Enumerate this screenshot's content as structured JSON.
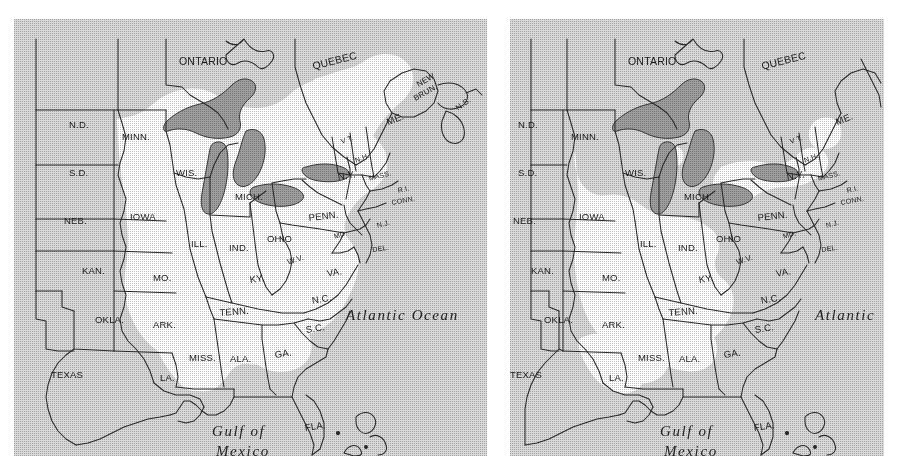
{
  "figure": {
    "type": "paired-range-map",
    "region": "Eastern North America",
    "panels": [
      {
        "id": "left",
        "name": "left-map",
        "range_extent": "larger",
        "water_labels": [
          {
            "text": "Atlantic Ocean",
            "x": 332,
            "y": 288
          },
          {
            "text": "Gulf of",
            "x": 198,
            "y": 404
          },
          {
            "text": "Mexico",
            "x": 202,
            "y": 424
          }
        ],
        "labels": [
          {
            "text": "ONTARIO",
            "x": 165,
            "y": 36,
            "rot": 0,
            "size": "big"
          },
          {
            "text": "QUEBEC",
            "x": 297,
            "y": 41,
            "rot": -14,
            "size": "big"
          },
          {
            "text": "NEW",
            "x": 401,
            "y": 62,
            "rot": -30,
            "size": "small"
          },
          {
            "text": "BRUN.",
            "x": 398,
            "y": 76,
            "rot": -30,
            "size": "small"
          },
          {
            "text": "N.S.",
            "x": 440,
            "y": 86,
            "rot": -36,
            "size": "small"
          },
          {
            "text": "N.D.",
            "x": 55,
            "y": 100,
            "rot": 0,
            "size": ""
          },
          {
            "text": "MINN.",
            "x": 108,
            "y": 112,
            "rot": 0,
            "size": ""
          },
          {
            "text": "ME.",
            "x": 371,
            "y": 98,
            "rot": -22,
            "size": ""
          },
          {
            "text": "S.D.",
            "x": 55,
            "y": 148,
            "rot": 0,
            "size": ""
          },
          {
            "text": "WIS.",
            "x": 162,
            "y": 148,
            "rot": 0,
            "size": ""
          },
          {
            "text": "V T.",
            "x": 326,
            "y": 119,
            "rot": -18,
            "size": "tiny"
          },
          {
            "text": "N.Y.",
            "x": 323,
            "y": 152,
            "rot": -8,
            "size": ""
          },
          {
            "text": "N.H.",
            "x": 340,
            "y": 138,
            "rot": -20,
            "size": "tiny"
          },
          {
            "text": "MASS.",
            "x": 354,
            "y": 156,
            "rot": -14,
            "size": "tiny"
          },
          {
            "text": "R.I.",
            "x": 383,
            "y": 168,
            "rot": -12,
            "size": "tiny"
          },
          {
            "text": "CONN.",
            "x": 377,
            "y": 180,
            "rot": -10,
            "size": "tiny"
          },
          {
            "text": "MICH.",
            "x": 221,
            "y": 172,
            "rot": 0,
            "size": ""
          },
          {
            "text": "NEB.",
            "x": 50,
            "y": 196,
            "rot": 0,
            "size": ""
          },
          {
            "text": "IOWA",
            "x": 116,
            "y": 192,
            "rot": 0,
            "size": ""
          },
          {
            "text": "PENN.",
            "x": 294,
            "y": 193,
            "rot": -6,
            "size": ""
          },
          {
            "text": "N.J.",
            "x": 362,
            "y": 203,
            "rot": -14,
            "size": "tiny"
          },
          {
            "text": "ILL.",
            "x": 177,
            "y": 219,
            "rot": 0,
            "size": ""
          },
          {
            "text": "IND.",
            "x": 215,
            "y": 223,
            "rot": 0,
            "size": ""
          },
          {
            "text": "OHIO",
            "x": 253,
            "y": 214,
            "rot": 0,
            "size": ""
          },
          {
            "text": "MD.",
            "x": 319,
            "y": 214,
            "rot": -16,
            "size": "tiny"
          },
          {
            "text": "DEL.",
            "x": 358,
            "y": 227,
            "rot": -8,
            "size": "tiny"
          },
          {
            "text": "KAN.",
            "x": 68,
            "y": 246,
            "rot": 0,
            "size": ""
          },
          {
            "text": "MO.",
            "x": 139,
            "y": 253,
            "rot": 0,
            "size": ""
          },
          {
            "text": "KY.",
            "x": 235,
            "y": 255,
            "rot": -8,
            "size": ""
          },
          {
            "text": "W.V.",
            "x": 272,
            "y": 239,
            "rot": -18,
            "size": "small"
          },
          {
            "text": "VA.",
            "x": 312,
            "y": 249,
            "rot": -10,
            "size": ""
          },
          {
            "text": "OKLA.",
            "x": 81,
            "y": 295,
            "rot": 0,
            "size": ""
          },
          {
            "text": "ARK.",
            "x": 139,
            "y": 300,
            "rot": 0,
            "size": ""
          },
          {
            "text": "TENN.",
            "x": 205,
            "y": 288,
            "rot": -4,
            "size": ""
          },
          {
            "text": "N.C.",
            "x": 297,
            "y": 276,
            "rot": -10,
            "size": ""
          },
          {
            "text": "S.C.",
            "x": 291,
            "y": 305,
            "rot": -8,
            "size": ""
          },
          {
            "text": "MISS.",
            "x": 175,
            "y": 333,
            "rot": 0,
            "size": ""
          },
          {
            "text": "ALA.",
            "x": 216,
            "y": 334,
            "rot": 0,
            "size": ""
          },
          {
            "text": "GA.",
            "x": 260,
            "y": 330,
            "rot": -8,
            "size": ""
          },
          {
            "text": "TEXAS",
            "x": 37,
            "y": 350,
            "rot": 0,
            "size": ""
          },
          {
            "text": "LA.",
            "x": 146,
            "y": 353,
            "rot": 0,
            "size": ""
          },
          {
            "text": "FLA.",
            "x": 290,
            "y": 403,
            "rot": -8,
            "size": ""
          }
        ]
      },
      {
        "id": "right",
        "name": "right-map",
        "range_extent": "reduced",
        "water_labels": [
          {
            "text": "Atlantic",
            "x": 305,
            "y": 288
          },
          {
            "text": "Gulf of",
            "x": 150,
            "y": 404
          },
          {
            "text": "Mexico",
            "x": 154,
            "y": 424
          }
        ],
        "labels": [
          {
            "text": "ONTARIO",
            "x": 118,
            "y": 36,
            "rot": 0,
            "size": "big"
          },
          {
            "text": "QUEBEC",
            "x": 250,
            "y": 41,
            "rot": -14,
            "size": "big"
          },
          {
            "text": "N.D.",
            "x": 8,
            "y": 100,
            "rot": 0,
            "size": ""
          },
          {
            "text": "MINN.",
            "x": 61,
            "y": 112,
            "rot": 0,
            "size": ""
          },
          {
            "text": "ME.",
            "x": 324,
            "y": 98,
            "rot": -22,
            "size": ""
          },
          {
            "text": "S.D.",
            "x": 8,
            "y": 148,
            "rot": 0,
            "size": ""
          },
          {
            "text": "WIS.",
            "x": 115,
            "y": 148,
            "rot": 0,
            "size": ""
          },
          {
            "text": "V T.",
            "x": 279,
            "y": 119,
            "rot": -18,
            "size": "tiny"
          },
          {
            "text": "N.Y.",
            "x": 276,
            "y": 152,
            "rot": -8,
            "size": ""
          },
          {
            "text": "N.H.",
            "x": 293,
            "y": 138,
            "rot": -20,
            "size": "tiny"
          },
          {
            "text": "MASS.",
            "x": 307,
            "y": 156,
            "rot": -14,
            "size": "tiny"
          },
          {
            "text": "R.I.",
            "x": 336,
            "y": 168,
            "rot": -12,
            "size": "tiny"
          },
          {
            "text": "CONN.",
            "x": 330,
            "y": 180,
            "rot": -10,
            "size": "tiny"
          },
          {
            "text": "MICH.",
            "x": 174,
            "y": 172,
            "rot": 0,
            "size": ""
          },
          {
            "text": "NEB.",
            "x": 3,
            "y": 196,
            "rot": 0,
            "size": ""
          },
          {
            "text": "IOWA",
            "x": 69,
            "y": 192,
            "rot": 0,
            "size": ""
          },
          {
            "text": "PENN.",
            "x": 247,
            "y": 193,
            "rot": -6,
            "size": ""
          },
          {
            "text": "N.J.",
            "x": 315,
            "y": 203,
            "rot": -14,
            "size": "tiny"
          },
          {
            "text": "ILL.",
            "x": 130,
            "y": 219,
            "rot": 0,
            "size": ""
          },
          {
            "text": "IND.",
            "x": 168,
            "y": 223,
            "rot": 0,
            "size": ""
          },
          {
            "text": "OHIO",
            "x": 206,
            "y": 214,
            "rot": 0,
            "size": ""
          },
          {
            "text": "MD.",
            "x": 272,
            "y": 214,
            "rot": -16,
            "size": "tiny"
          },
          {
            "text": "DEL.",
            "x": 311,
            "y": 227,
            "rot": -8,
            "size": "tiny"
          },
          {
            "text": "KAN.",
            "x": 21,
            "y": 246,
            "rot": 0,
            "size": ""
          },
          {
            "text": "MO.",
            "x": 92,
            "y": 253,
            "rot": 0,
            "size": ""
          },
          {
            "text": "KY.",
            "x": 188,
            "y": 255,
            "rot": -8,
            "size": ""
          },
          {
            "text": "W.V.",
            "x": 225,
            "y": 239,
            "rot": -18,
            "size": "small"
          },
          {
            "text": "VA.",
            "x": 265,
            "y": 249,
            "rot": -10,
            "size": ""
          },
          {
            "text": "OKLA.",
            "x": 34,
            "y": 295,
            "rot": 0,
            "size": ""
          },
          {
            "text": "ARK.",
            "x": 92,
            "y": 300,
            "rot": 0,
            "size": ""
          },
          {
            "text": "TENN.",
            "x": 158,
            "y": 288,
            "rot": -4,
            "size": ""
          },
          {
            "text": "N.C.",
            "x": 250,
            "y": 276,
            "rot": -10,
            "size": ""
          },
          {
            "text": "S.C.",
            "x": 244,
            "y": 305,
            "rot": -8,
            "size": ""
          },
          {
            "text": "MISS.",
            "x": 128,
            "y": 333,
            "rot": 0,
            "size": ""
          },
          {
            "text": "ALA.",
            "x": 169,
            "y": 334,
            "rot": 0,
            "size": ""
          },
          {
            "text": "GA.",
            "x": 213,
            "y": 330,
            "rot": -8,
            "size": ""
          },
          {
            "text": "TEXAS",
            "x": 0,
            "y": 350,
            "rot": 0,
            "size": ""
          },
          {
            "text": "LA.",
            "x": 99,
            "y": 353,
            "rot": 0,
            "size": ""
          },
          {
            "text": "FLA.",
            "x": 243,
            "y": 403,
            "rot": -8,
            "size": ""
          }
        ]
      }
    ]
  },
  "colors": {
    "background": "#ffffff",
    "outside_range": "#d9d9d9",
    "inside_range": "#ffffff",
    "lakes": "#9e9e9e",
    "border_line": "#2b2b2b",
    "text": "#1a1a1a"
  }
}
